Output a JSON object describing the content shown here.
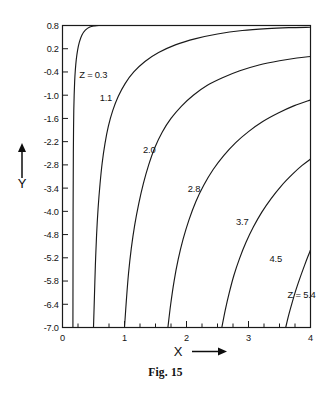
{
  "caption": "Fig. 15",
  "axes": {
    "x_title": "X",
    "y_title": "Y",
    "x_arrow_icon": "right-arrow-icon",
    "y_arrow_icon": "up-arrow-icon"
  },
  "chart_data": {
    "type": "line",
    "title": "Fig. 15",
    "xlabel": "X",
    "ylabel": "Y",
    "xlim": [
      0,
      4
    ],
    "ylim": [
      -7.0,
      0.8
    ],
    "grid": false,
    "legend": "inline-curve-labels",
    "x_ticks": [
      "0",
      "1",
      "2",
      "3",
      "4"
    ],
    "x_tick_values": [
      0,
      1,
      2,
      3,
      4
    ],
    "x_minor_ticks_per_interval": 4,
    "y_ticks": [
      "0.8",
      "0.2",
      "-0.4",
      "-1.0",
      "-1.6",
      "-2.2",
      "-2.8",
      "-3.4",
      "-4.0",
      "-4.8",
      "-5.2",
      "-5.8",
      "-6.4",
      "-7.0"
    ],
    "y_tick_values": [
      0.8,
      0.2,
      -0.4,
      -1.0,
      -1.6,
      -2.2,
      -2.8,
      -3.4,
      -4.0,
      -4.6,
      -5.2,
      -5.8,
      -6.4,
      -7.0
    ],
    "series": [
      {
        "name": "Z = 0.3",
        "label": "Z = 0.3",
        "label_x": 0.27,
        "label_y": -0.55,
        "points": [
          [
            0.168,
            -7.0
          ],
          [
            0.169,
            -6.0
          ],
          [
            0.17,
            -5.0
          ],
          [
            0.171,
            -4.0
          ],
          [
            0.173,
            -3.2
          ],
          [
            0.175,
            -2.5
          ],
          [
            0.178,
            -1.9
          ],
          [
            0.182,
            -1.4
          ],
          [
            0.188,
            -1.0
          ],
          [
            0.196,
            -0.65
          ],
          [
            0.207,
            -0.35
          ],
          [
            0.222,
            -0.08
          ],
          [
            0.243,
            0.16
          ],
          [
            0.272,
            0.37
          ],
          [
            0.312,
            0.55
          ],
          [
            0.368,
            0.68
          ],
          [
            0.44,
            0.762
          ],
          [
            0.52,
            0.79
          ],
          [
            0.6,
            0.8
          ]
        ]
      },
      {
        "name": "1.1",
        "label": "1.1",
        "label_x": 0.6,
        "label_y": -1.15,
        "points": [
          [
            0.5,
            -7.0
          ],
          [
            0.515,
            -6.2
          ],
          [
            0.53,
            -5.4
          ],
          [
            0.55,
            -4.6
          ],
          [
            0.575,
            -3.9
          ],
          [
            0.605,
            -3.3
          ],
          [
            0.64,
            -2.75
          ],
          [
            0.685,
            -2.25
          ],
          [
            0.74,
            -1.8
          ],
          [
            0.81,
            -1.4
          ],
          [
            0.9,
            -1.03
          ],
          [
            1.01,
            -0.7
          ],
          [
            1.15,
            -0.4
          ],
          [
            1.33,
            -0.13
          ],
          [
            1.55,
            0.1
          ],
          [
            1.82,
            0.3
          ],
          [
            2.15,
            0.46
          ],
          [
            2.5,
            0.58
          ],
          [
            2.9,
            0.67
          ],
          [
            3.3,
            0.72
          ],
          [
            3.65,
            0.745
          ],
          [
            4.0,
            0.755
          ]
        ]
      },
      {
        "name": "2.0",
        "label": "2.0",
        "label_x": 1.3,
        "label_y": -2.5,
        "points": [
          [
            1.0,
            -7.0
          ],
          [
            1.03,
            -6.3
          ],
          [
            1.065,
            -5.6
          ],
          [
            1.11,
            -4.95
          ],
          [
            1.165,
            -4.35
          ],
          [
            1.23,
            -3.8
          ],
          [
            1.305,
            -3.28
          ],
          [
            1.39,
            -2.8
          ],
          [
            1.49,
            -2.35
          ],
          [
            1.61,
            -1.95
          ],
          [
            1.75,
            -1.6
          ],
          [
            1.92,
            -1.28
          ],
          [
            2.11,
            -1.0
          ],
          [
            2.33,
            -0.75
          ],
          [
            2.58,
            -0.55
          ],
          [
            2.86,
            -0.37
          ],
          [
            3.17,
            -0.22
          ],
          [
            3.5,
            -0.11
          ],
          [
            3.78,
            -0.04
          ],
          [
            4.0,
            0.0
          ]
        ]
      },
      {
        "name": "2.8",
        "label": "2.8",
        "label_x": 2.02,
        "label_y": -3.5,
        "points": [
          [
            1.7,
            -7.0
          ],
          [
            1.745,
            -6.4
          ],
          [
            1.8,
            -5.8
          ],
          [
            1.865,
            -5.25
          ],
          [
            1.945,
            -4.72
          ],
          [
            2.04,
            -4.22
          ],
          [
            2.15,
            -3.75
          ],
          [
            2.28,
            -3.32
          ],
          [
            2.43,
            -2.92
          ],
          [
            2.6,
            -2.56
          ],
          [
            2.79,
            -2.23
          ],
          [
            3.0,
            -1.94
          ],
          [
            3.23,
            -1.68
          ],
          [
            3.48,
            -1.46
          ],
          [
            3.74,
            -1.27
          ],
          [
            4.0,
            -1.12
          ]
        ]
      },
      {
        "name": "3.7",
        "label": "3.7",
        "label_x": 2.8,
        "label_y": -4.35,
        "points": [
          [
            2.57,
            -7.0
          ],
          [
            2.625,
            -6.55
          ],
          [
            2.69,
            -6.1
          ],
          [
            2.765,
            -5.65
          ],
          [
            2.855,
            -5.22
          ],
          [
            2.96,
            -4.8
          ],
          [
            3.08,
            -4.4
          ],
          [
            3.215,
            -4.02
          ],
          [
            3.365,
            -3.67
          ],
          [
            3.53,
            -3.34
          ],
          [
            3.71,
            -3.04
          ],
          [
            3.86,
            -2.82
          ],
          [
            4.0,
            -2.65
          ]
        ]
      },
      {
        "name": "4.5",
        "label": "4.5",
        "label_x": 3.34,
        "label_y": -5.32,
        "points": [
          [
            3.6,
            -7.0
          ],
          [
            3.65,
            -6.67
          ],
          [
            3.705,
            -6.35
          ],
          [
            3.765,
            -6.03
          ],
          [
            3.835,
            -5.7
          ],
          [
            3.91,
            -5.37
          ],
          [
            3.96,
            -5.16
          ],
          [
            4.0,
            -5.0
          ]
        ]
      },
      {
        "name": "Z = 5.4",
        "label": "Z = 5.4",
        "label_x": 3.63,
        "label_y": -6.25,
        "points": []
      }
    ]
  }
}
